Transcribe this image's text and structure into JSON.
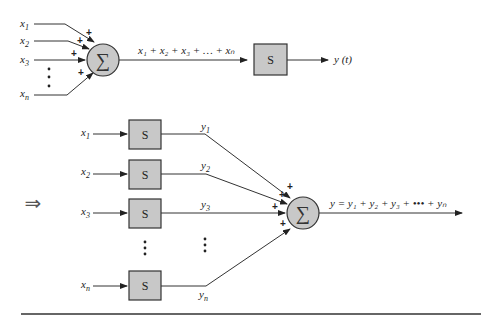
{
  "top_diagram": {
    "inputs": [
      {
        "base": "x",
        "sub": "1"
      },
      {
        "base": "x",
        "sub": "2"
      },
      {
        "base": "x",
        "sub": "3"
      },
      {
        "base": "x",
        "sub": "n"
      }
    ],
    "ellipsis": "⋮",
    "plus_sign": "+",
    "summer_symbol": "∑",
    "sum_expression": "x₁ + x₂ + x₃ + … + xₙ",
    "system_label": "S",
    "output_label": "y (t)"
  },
  "implies_arrow": "⇒",
  "bottom_diagram": {
    "branches": [
      {
        "input": "x",
        "input_sub": "1",
        "system": "S",
        "output": "y",
        "output_sub": "1"
      },
      {
        "input": "x",
        "input_sub": "2",
        "system": "S",
        "output": "y",
        "output_sub": "2"
      },
      {
        "input": "x",
        "input_sub": "3",
        "system": "S",
        "output": "y",
        "output_sub": "3"
      },
      {
        "input": "x",
        "input_sub": "n",
        "system": "S",
        "output": "y",
        "output_sub": "n"
      }
    ],
    "ellipsis": "⋮",
    "plus_sign": "+",
    "summer_symbol": "∑",
    "sum_expression": "y = y₁ + y₂ + y₃ + ••• + yₙ"
  },
  "colors": {
    "block_fill": "#c8c8c8",
    "line": "#333333",
    "background": "#ffffff"
  }
}
